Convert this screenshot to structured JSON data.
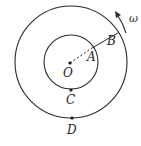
{
  "diagram": {
    "type": "concentric-circles",
    "colors": {
      "stroke": "#2a2a2a",
      "background": "#ffffff"
    },
    "center": {
      "label": "O",
      "x": 70,
      "y": 63
    },
    "outer_circle": {
      "r": 56
    },
    "inner_circle": {
      "r": 27
    },
    "points": [
      {
        "label": "A",
        "x": 92,
        "y": 48,
        "label_x": 88,
        "label_y": 62
      },
      {
        "label": "B",
        "x": 118,
        "y": 33,
        "label_x": 106,
        "label_y": 45
      },
      {
        "label": "C",
        "x": 71,
        "y": 90,
        "label_x": 66,
        "label_y": 104
      },
      {
        "label": "D",
        "x": 72,
        "y": 119,
        "label_x": 68,
        "label_y": 134
      }
    ],
    "segments": [
      {
        "from": "O",
        "to": "A",
        "style": "dashed"
      },
      {
        "from": "A",
        "to": "B",
        "style": "solid"
      }
    ],
    "rotation": {
      "label": "ω",
      "direction": "counterclockwise",
      "label_x": 129,
      "label_y": 22
    }
  }
}
